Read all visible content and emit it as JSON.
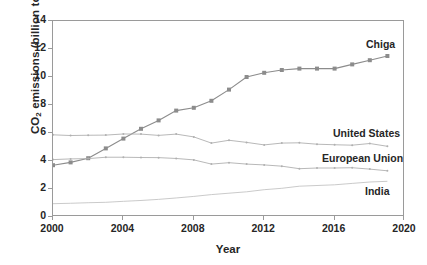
{
  "chart_data": {
    "type": "line",
    "title": "",
    "xlabel": "Year",
    "ylabel": "CO2 emissions (billion tons)",
    "ylabel_parts": {
      "prefix": "CO",
      "sub": "2",
      "suffix": " emissions (billion tons)"
    },
    "xlim": [
      2000,
      2020
    ],
    "ylim": [
      0,
      14
    ],
    "xticks": [
      2000,
      2004,
      2008,
      2012,
      2016,
      2020
    ],
    "yticks": [
      0,
      2,
      4,
      6,
      8,
      10,
      12,
      14
    ],
    "grid": false,
    "legend_position": "inline-right",
    "x": [
      2000,
      2001,
      2002,
      2003,
      2004,
      2005,
      2006,
      2007,
      2008,
      2009,
      2010,
      2011,
      2012,
      2013,
      2014,
      2015,
      2016,
      2017,
      2018,
      2019
    ],
    "series": [
      {
        "name": "Chiga",
        "color": "#8c8c8c",
        "marker": "square",
        "marker_size": 4,
        "label_id": "lbl-china",
        "values": [
          3.7,
          3.9,
          4.2,
          4.9,
          5.6,
          6.3,
          6.9,
          7.6,
          7.8,
          8.3,
          9.1,
          10.0,
          10.3,
          10.5,
          10.6,
          10.6,
          10.6,
          10.9,
          11.2,
          11.5
        ]
      },
      {
        "name": "United States",
        "color": "#b0b0b0",
        "marker": "dot",
        "marker_size": 2,
        "label_id": "lbl-us",
        "values": [
          5.87,
          5.82,
          5.84,
          5.85,
          5.93,
          5.92,
          5.83,
          5.92,
          5.72,
          5.28,
          5.48,
          5.33,
          5.15,
          5.28,
          5.3,
          5.2,
          5.16,
          5.13,
          5.25,
          5.05
        ]
      },
      {
        "name": "European Union",
        "color": "#b0b0b0",
        "marker": "dot",
        "marker_size": 2,
        "label_id": "lbl-eu",
        "values": [
          4.1,
          4.15,
          4.17,
          4.27,
          4.27,
          4.25,
          4.24,
          4.18,
          4.08,
          3.78,
          3.88,
          3.78,
          3.72,
          3.63,
          3.45,
          3.5,
          3.5,
          3.52,
          3.42,
          3.3
        ]
      },
      {
        "name": "India",
        "color": "#c4c4c4",
        "marker": "none",
        "marker_size": 0,
        "label_id": "lbl-india",
        "values": [
          0.95,
          0.98,
          1.02,
          1.05,
          1.12,
          1.18,
          1.26,
          1.36,
          1.47,
          1.6,
          1.7,
          1.8,
          1.95,
          2.05,
          2.2,
          2.25,
          2.3,
          2.4,
          2.5,
          2.55
        ]
      }
    ]
  },
  "axis": {
    "y_tick_labels": [
      "14",
      "12",
      "10",
      "8",
      "6",
      "4",
      "2",
      "0"
    ],
    "x_tick_labels": [
      "2000",
      "2004",
      "2008",
      "2012",
      "2016",
      "2020"
    ],
    "x_title": "Year"
  },
  "labels": {
    "china": "Chiga",
    "united_states": "United States",
    "european_union": "European Union",
    "india": "India"
  },
  "colors": {
    "frame": "#9a9a9a",
    "china": "#8c8c8c",
    "united_states": "#b0b0b0",
    "european_union": "#b0b0b0",
    "india": "#c4c4c4",
    "text": "#262626",
    "background": "#ffffff"
  }
}
